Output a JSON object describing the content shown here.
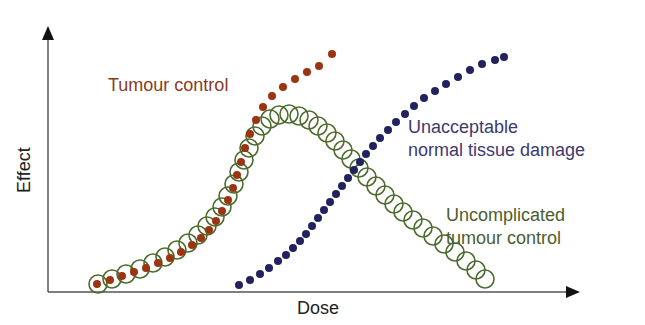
{
  "chart_data": {
    "type": "scatter",
    "title": "",
    "xlabel": "Dose",
    "ylabel": "Effect",
    "grid": false,
    "axes": {
      "x_ticks": [],
      "y_ticks": [],
      "arrows": true
    },
    "series": [
      {
        "name": "Tumour control",
        "marker": "filled-dot",
        "color": "#9a3412",
        "label_lines": [
          "Tumour control"
        ],
        "points_px": [
          [
            97,
            284
          ],
          [
            110,
            280
          ],
          [
            122,
            276
          ],
          [
            134,
            272
          ],
          [
            146,
            268
          ],
          [
            158,
            263
          ],
          [
            170,
            258
          ],
          [
            181,
            252
          ],
          [
            192,
            245
          ],
          [
            201,
            238
          ],
          [
            209,
            230
          ],
          [
            216,
            221
          ],
          [
            222,
            211
          ],
          [
            228,
            200
          ],
          [
            233,
            188
          ],
          [
            237,
            175
          ],
          [
            241,
            162
          ],
          [
            245,
            148
          ],
          [
            250,
            134
          ],
          [
            256,
            120
          ],
          [
            263,
            107
          ],
          [
            272,
            96
          ],
          [
            283,
            87
          ],
          [
            295,
            79
          ],
          [
            307,
            72
          ],
          [
            319,
            66
          ],
          [
            332,
            54
          ]
        ]
      },
      {
        "name": "Unacceptable normal tissue damage",
        "marker": "filled-dot",
        "color": "#22225f",
        "label_lines": [
          "Unacceptable",
          "normal tissue damage"
        ],
        "points_px": [
          [
            239,
            285
          ],
          [
            250,
            280
          ],
          [
            260,
            274
          ],
          [
            269,
            268
          ],
          [
            278,
            261
          ],
          [
            286,
            255
          ],
          [
            293,
            248
          ],
          [
            300,
            241
          ],
          [
            306,
            234
          ],
          [
            312,
            226
          ],
          [
            318,
            218
          ],
          [
            324,
            210
          ],
          [
            330,
            202
          ],
          [
            336,
            194
          ],
          [
            342,
            186
          ],
          [
            348,
            178
          ],
          [
            354,
            170
          ],
          [
            360,
            162
          ],
          [
            366,
            154
          ],
          [
            373,
            146
          ],
          [
            380,
            138
          ],
          [
            388,
            130
          ],
          [
            396,
            122
          ],
          [
            405,
            114
          ],
          [
            414,
            106
          ],
          [
            424,
            98
          ],
          [
            435,
            91
          ],
          [
            446,
            84
          ],
          [
            458,
            77
          ],
          [
            470,
            70
          ],
          [
            482,
            64
          ],
          [
            495,
            60
          ],
          [
            504,
            57
          ]
        ]
      },
      {
        "name": "Uncomplicated tumour control",
        "marker": "open-circle",
        "color": "#4d6b2e",
        "label_lines": [
          "Uncomplicated",
          "tumour control"
        ],
        "points_px": [
          [
            98,
            284
          ],
          [
            112,
            279
          ],
          [
            126,
            274
          ],
          [
            140,
            269
          ],
          [
            153,
            263
          ],
          [
            165,
            257
          ],
          [
            177,
            250
          ],
          [
            188,
            243
          ],
          [
            198,
            235
          ],
          [
            207,
            226
          ],
          [
            215,
            217
          ],
          [
            222,
            207
          ],
          [
            228,
            196
          ],
          [
            234,
            184
          ],
          [
            239,
            172
          ],
          [
            244,
            160
          ],
          [
            249,
            148
          ],
          [
            255,
            136
          ],
          [
            262,
            126
          ],
          [
            270,
            119
          ],
          [
            279,
            115
          ],
          [
            289,
            114
          ],
          [
            299,
            116
          ],
          [
            309,
            120
          ],
          [
            318,
            126
          ],
          [
            327,
            133
          ],
          [
            335,
            141
          ],
          [
            343,
            150
          ],
          [
            351,
            159
          ],
          [
            359,
            168
          ],
          [
            367,
            177
          ],
          [
            376,
            186
          ],
          [
            385,
            195
          ],
          [
            394,
            204
          ],
          [
            403,
            212
          ],
          [
            413,
            220
          ],
          [
            423,
            228
          ],
          [
            433,
            236
          ],
          [
            444,
            244
          ],
          [
            455,
            252
          ],
          [
            466,
            261
          ],
          [
            476,
            270
          ],
          [
            485,
            279
          ]
        ]
      }
    ],
    "labels": {
      "tumour_control": "Tumour control",
      "unacceptable_line1": "Unacceptable",
      "unacceptable_line2": "normal tissue damage",
      "uncomplicated_line1": "Uncomplicated",
      "uncomplicated_line2": "tumour control",
      "x_axis": "Dose",
      "y_axis": "Effect"
    },
    "layout": {
      "origin_px": [
        48,
        292
      ],
      "x_axis_end_px": [
        580,
        292
      ],
      "y_axis_end_px": [
        48,
        26
      ]
    }
  }
}
